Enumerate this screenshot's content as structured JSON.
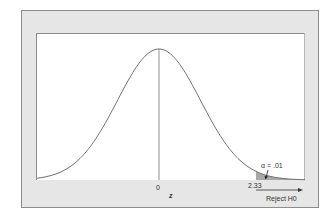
{
  "chart_data": {
    "type": "line",
    "title": "",
    "xlabel": "z",
    "ylabel": "",
    "x_ticks": [
      "0"
    ],
    "critical_value": 2.33,
    "critical_value_label": "2.33",
    "alpha_label": "α = .01",
    "region_label": "Reject H0",
    "xlim": [
      -2.96,
      3.51
    ],
    "grid": false,
    "legend": "none",
    "series": [
      {
        "name": "N(0,1) density",
        "x": [
          -3,
          -2.5,
          -2,
          -1.5,
          -1,
          -0.5,
          0,
          0.5,
          1,
          1.5,
          2,
          2.5,
          3,
          3.5
        ],
        "y": [
          0.0044,
          0.0175,
          0.054,
          0.1295,
          0.242,
          0.3521,
          0.3989,
          0.3521,
          0.242,
          0.1295,
          0.054,
          0.0175,
          0.0044,
          0.0009
        ]
      }
    ],
    "shaded_region": {
      "from": 2.33,
      "to": 3.51,
      "color": "#a0a0a0"
    }
  },
  "labels": {
    "zero": "0",
    "z": "z",
    "crit": "2.33",
    "alpha": "α = .01",
    "reject": "Reject H0"
  }
}
